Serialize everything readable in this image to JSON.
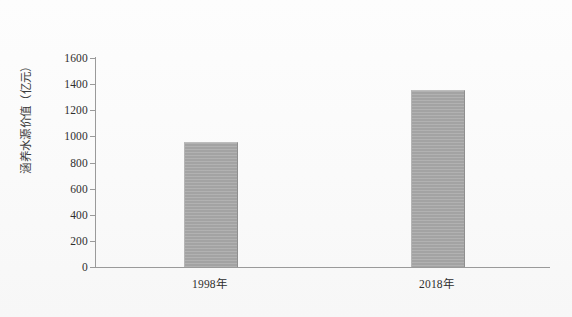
{
  "chart_data": {
    "type": "bar",
    "title": "",
    "subtitle": "",
    "xlabel": "",
    "ylabel": "涵养水源价值（亿元）",
    "categories": [
      "1998年",
      "2018年"
    ],
    "values": [
      950,
      1350
    ],
    "series": [
      {
        "name": "涵养水源价值",
        "values": [
          950,
          1350
        ],
        "color": "#a3a3a3"
      }
    ],
    "ylim": [
      0,
      1600
    ],
    "yticks": [
      0,
      200,
      400,
      600,
      800,
      1000,
      1200,
      1400,
      1600
    ],
    "ytick_labels": [
      "0",
      "200",
      "400",
      "600",
      "800",
      "1000",
      "1200",
      "1400",
      "1600"
    ],
    "grid": false,
    "legend": false,
    "legend_position": "none",
    "annotations": []
  },
  "axes": {
    "y_title": "涵养水源价值（亿元）",
    "y_axis_color": "#9a9a9a",
    "x_axis_color": "#9a9a9a"
  },
  "style": {
    "background": "#fcfcfc",
    "bar_color": "#a3a3a3",
    "text_color": "#2e2e2e"
  }
}
